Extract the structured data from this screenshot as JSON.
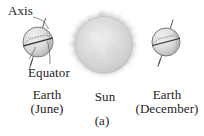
{
  "figure": {
    "caption": "(a)",
    "labels": {
      "axis": "Axis",
      "equator": "Equator",
      "earth_june_name": "Earth",
      "earth_june_month": "(June)",
      "sun": "Sun",
      "earth_december_name": "Earth",
      "earth_december_month": "(December)"
    },
    "colors": {
      "background": "#ffffff",
      "text": "#1c1c1c",
      "line": "#4a4a4a",
      "earth_fill_light": "#e9e9e9",
      "earth_fill_shadow": "#b9b9b9",
      "earth_stroke": "#5a5a5a",
      "sun_fill": "#d8d8d8",
      "sun_core": "#e6e6e6",
      "sun_corona": "#bcbcbc"
    },
    "objects": {
      "earth_june": {
        "cx": 38,
        "cy": 42,
        "r": 15,
        "axis_tilt_deg": 23
      },
      "sun": {
        "cx": 104,
        "cy": 45,
        "r": 29
      },
      "earth_december": {
        "cx": 166,
        "cy": 42,
        "r": 14,
        "axis_tilt_deg": 23
      }
    }
  }
}
